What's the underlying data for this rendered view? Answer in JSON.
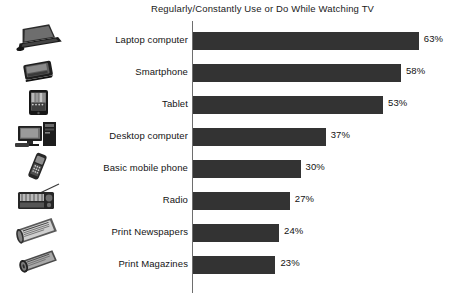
{
  "chart_data": {
    "type": "bar",
    "orientation": "horizontal",
    "title": "Regularly/Constantly Use or Do While Watching TV",
    "xlabel": "",
    "ylabel": "",
    "xlim": [
      0,
      70
    ],
    "grid": false,
    "legend": null,
    "value_suffix": "%",
    "bar_color": "#333333",
    "axis_color": "#6e6e6e",
    "categories": [
      "Laptop computer",
      "Smartphone",
      "Tablet",
      "Desktop computer",
      "Basic mobile phone",
      "Radio",
      "Print Newspapers",
      "Print Magazines"
    ],
    "values": [
      63,
      58,
      53,
      37,
      30,
      27,
      24,
      23
    ],
    "value_labels": [
      "63%",
      "58%",
      "53%",
      "37%",
      "30%",
      "27%",
      "24%",
      "23%"
    ],
    "icons": [
      "laptop-computer-icon",
      "smartphone-icon",
      "tablet-icon",
      "desktop-computer-icon",
      "basic-mobile-phone-icon",
      "radio-icon",
      "print-newspapers-icon",
      "print-magazines-icon"
    ]
  }
}
